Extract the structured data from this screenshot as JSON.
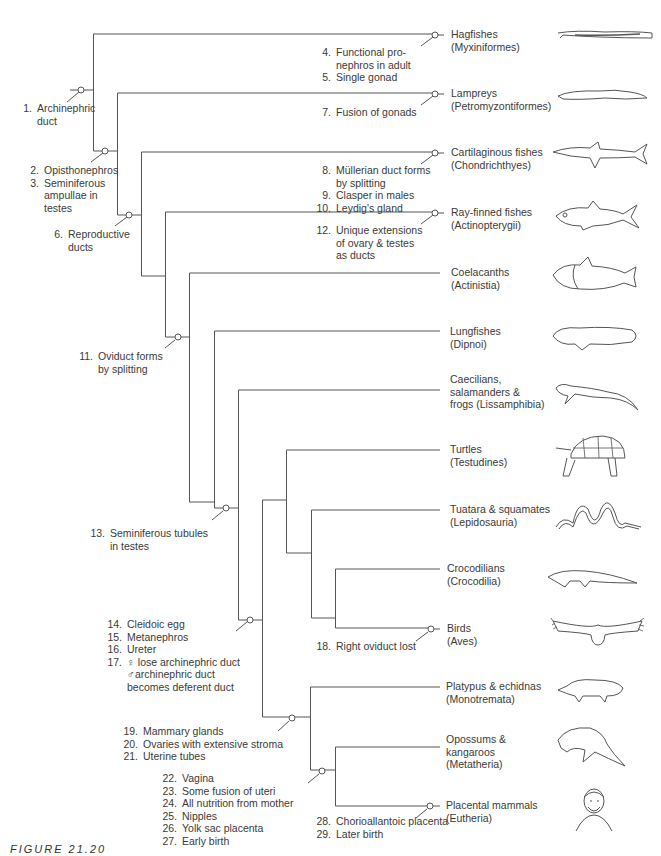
{
  "figure": {
    "caption": "FIGURE 21.20",
    "line_color": "#555555",
    "text_color": "#3a3a3a",
    "background": "#ffffff"
  },
  "taxa": [
    {
      "common": "Hagfishes",
      "scientific": "(Myxiniformes)",
      "icon": "hagfish-icon"
    },
    {
      "common": "Lampreys",
      "scientific": "(Petromyzontiformes)",
      "icon": "lamprey-icon"
    },
    {
      "common": "Cartilaginous fishes",
      "scientific": "(Chondrichthyes)",
      "icon": "shark-icon"
    },
    {
      "common": "Ray-finned fishes",
      "scientific": "(Actinopterygii)",
      "icon": "ray-finned-fish-icon"
    },
    {
      "common": "Coelacanths",
      "scientific": "(Actinistia)",
      "icon": "coelacanth-icon"
    },
    {
      "common": "Lungfishes",
      "scientific": "(Dipnoi)",
      "icon": "lungfish-icon"
    },
    {
      "common": "Caecilians,",
      "common2": "salamanders &",
      "scientific": "frogs (Lissamphibia)",
      "icon": "salamander-icon"
    },
    {
      "common": "Turtles",
      "scientific": "(Testudines)",
      "icon": "turtle-icon"
    },
    {
      "common": "Tuatara & squamates",
      "scientific": "(Lepidosauria)",
      "icon": "snake-icon"
    },
    {
      "common": "Crocodilians",
      "scientific": "(Crocodilia)",
      "icon": "crocodile-icon"
    },
    {
      "common": "Birds",
      "scientific": "(Aves)",
      "icon": "bird-icon"
    },
    {
      "common": "Platypus & echidnas",
      "scientific": "(Monotremata)",
      "icon": "platypus-icon"
    },
    {
      "common": "Opossums &",
      "common2": "kangaroos",
      "scientific": "(Metatheria)",
      "icon": "kangaroo-icon"
    },
    {
      "common": "Placental mammals",
      "scientific": "(Eutheria)",
      "icon": "human-portrait-icon"
    }
  ],
  "characters": {
    "c1": {
      "n": "1.",
      "lines": [
        "Archinephric",
        "duct"
      ]
    },
    "c2": {
      "n": "2.",
      "lines": [
        "Opisthonephros"
      ]
    },
    "c3": {
      "n": "3.",
      "lines": [
        "Seminiferous",
        "ampullae in",
        "testes"
      ]
    },
    "c4": {
      "n": "4.",
      "lines": [
        "Functional pro-",
        "nephros in adult"
      ]
    },
    "c5": {
      "n": "5.",
      "lines": [
        "Single gonad"
      ]
    },
    "c6": {
      "n": "6.",
      "lines": [
        "Reproductive",
        "ducts"
      ]
    },
    "c7": {
      "n": "7.",
      "lines": [
        "Fusion of gonads"
      ]
    },
    "c8": {
      "n": "8.",
      "lines": [
        "Müllerian duct forms",
        "by splitting"
      ]
    },
    "c9": {
      "n": "9.",
      "lines": [
        "Clasper in males"
      ]
    },
    "c10": {
      "n": "10.",
      "lines": [
        "Leydig's gland"
      ]
    },
    "c11": {
      "n": "11.",
      "lines": [
        "Oviduct forms",
        "by splitting"
      ]
    },
    "c12": {
      "n": "12.",
      "lines": [
        "Unique extensions",
        "of ovary & testes",
        "as ducts"
      ]
    },
    "c13": {
      "n": "13.",
      "lines": [
        "Seminiferous tubules",
        "in testes"
      ]
    },
    "c14": {
      "n": "14.",
      "lines": [
        "Cleidoic egg"
      ]
    },
    "c15": {
      "n": "15.",
      "lines": [
        "Metanephros"
      ]
    },
    "c16": {
      "n": "16.",
      "lines": [
        "Ureter"
      ]
    },
    "c17": {
      "n": "17.",
      "lines": [
        "♀ lose archinephric duct",
        "♂archinephric duct",
        "becomes deferent duct"
      ]
    },
    "c18": {
      "n": "18.",
      "lines": [
        "Right oviduct lost"
      ]
    },
    "c19": {
      "n": "19.",
      "lines": [
        "Mammary glands"
      ]
    },
    "c20": {
      "n": "20.",
      "lines": [
        "Ovaries with extensive stroma"
      ]
    },
    "c21": {
      "n": "21.",
      "lines": [
        "Uterine tubes"
      ]
    },
    "c22": {
      "n": "22.",
      "lines": [
        "Vagina"
      ]
    },
    "c23": {
      "n": "23.",
      "lines": [
        "Some fusion of uteri"
      ]
    },
    "c24": {
      "n": "24.",
      "lines": [
        "All nutrition from mother"
      ]
    },
    "c25": {
      "n": "25.",
      "lines": [
        "Nipples"
      ]
    },
    "c26": {
      "n": "26.",
      "lines": [
        "Yolk sac placenta"
      ]
    },
    "c27": {
      "n": "27.",
      "lines": [
        "Early birth"
      ]
    },
    "c28": {
      "n": "28.",
      "lines": [
        "Chorioallantoic placenta"
      ]
    },
    "c29": {
      "n": "29.",
      "lines": [
        "Later birth"
      ]
    }
  }
}
